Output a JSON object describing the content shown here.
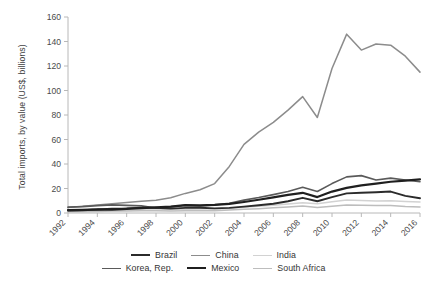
{
  "chart_data": {
    "type": "line",
    "title": "",
    "xlabel": "",
    "ylabel": "Total imports, by value (US$, billions)",
    "x": [
      1992,
      1993,
      1994,
      1995,
      1996,
      1997,
      1998,
      1999,
      2000,
      2001,
      2002,
      2003,
      2004,
      2005,
      2006,
      2007,
      2008,
      2009,
      2010,
      2011,
      2012,
      2013,
      2014,
      2015,
      2016
    ],
    "xticklabels": [
      "1992",
      "1994",
      "1996",
      "1998",
      "2000",
      "2002",
      "2004",
      "2006",
      "2008",
      "2010",
      "2012",
      "2014",
      "2016"
    ],
    "yticklabels": [
      "0",
      "20",
      "40",
      "60",
      "80",
      "100",
      "120",
      "140",
      "160"
    ],
    "ylim": [
      0,
      160
    ],
    "xlim": [
      1992,
      2016
    ],
    "grid": false,
    "legend_position": "bottom",
    "series": [
      {
        "name": "Brazil",
        "color": "#2b2b2b",
        "width": 1.9,
        "values": [
          2.0,
          2.3,
          2.8,
          3.6,
          3.8,
          4.4,
          4.3,
          3.6,
          4.2,
          4.3,
          3.8,
          4.2,
          5.2,
          6.3,
          7.6,
          9.6,
          12.4,
          9.6,
          13.0,
          16.0,
          16.5,
          17.0,
          17.5,
          14.0,
          12.0
        ]
      },
      {
        "name": "China",
        "color": "#8c8c8c",
        "width": 1.5,
        "values": [
          4.5,
          5.5,
          6.5,
          7.5,
          8.5,
          9.5,
          10.5,
          12.5,
          16.0,
          19.0,
          24.0,
          38.0,
          56.0,
          66.0,
          74.0,
          84.0,
          95.0,
          78.0,
          118.0,
          146.0,
          133.0,
          138.0,
          137.0,
          128.0,
          115.0
        ]
      },
      {
        "name": "India",
        "color": "#d2d2d2",
        "width": 1.5,
        "values": [
          1.2,
          1.4,
          1.6,
          2.0,
          2.2,
          2.4,
          2.5,
          2.8,
          3.1,
          3.2,
          3.4,
          3.9,
          4.7,
          5.5,
          6.4,
          7.4,
          8.4,
          7.6,
          9.2,
          10.6,
          10.2,
          9.8,
          10.0,
          9.4,
          9.0
        ]
      },
      {
        "name": "Korea, Rep.",
        "color": "#5a5a5a",
        "width": 1.6,
        "values": [
          4.8,
          5.2,
          6.0,
          6.6,
          6.2,
          5.8,
          4.0,
          5.0,
          6.2,
          5.8,
          6.6,
          8.0,
          10.5,
          12.6,
          15.0,
          17.5,
          21.0,
          17.5,
          24.0,
          29.5,
          30.5,
          27.0,
          28.5,
          27.0,
          25.5
        ]
      },
      {
        "name": "Mexico",
        "color": "#1f1f1f",
        "width": 2.2,
        "values": [
          2.4,
          2.6,
          3.0,
          2.8,
          3.4,
          4.0,
          4.6,
          5.2,
          6.4,
          6.2,
          6.6,
          7.4,
          9.0,
          10.8,
          12.8,
          14.8,
          16.5,
          13.0,
          17.5,
          20.5,
          22.5,
          24.0,
          25.5,
          26.5,
          27.5
        ]
      },
      {
        "name": "South Africa",
        "color": "#bdbdbd",
        "width": 1.5,
        "values": [
          1.0,
          1.1,
          1.3,
          1.6,
          1.7,
          1.8,
          1.8,
          1.7,
          1.9,
          1.8,
          1.9,
          2.4,
          3.0,
          3.5,
          4.2,
          5.0,
          5.8,
          4.4,
          5.6,
          6.6,
          6.4,
          6.2,
          6.2,
          5.4,
          5.0
        ]
      }
    ]
  },
  "legend": {
    "rows": [
      [
        {
          "label": "Brazil",
          "color": "#2b2b2b",
          "width": 2.2
        },
        {
          "label": "China",
          "color": "#8c8c8c",
          "width": 1.6
        },
        {
          "label": "India",
          "color": "#d2d2d2",
          "width": 1.6
        }
      ],
      [
        {
          "label": "Korea, Rep.",
          "color": "#5a5a5a",
          "width": 1.8
        },
        {
          "label": "Mexico",
          "color": "#1f1f1f",
          "width": 2.6
        },
        {
          "label": "South Africa",
          "color": "#bdbdbd",
          "width": 1.6
        }
      ]
    ]
  },
  "axes": {
    "axis_color": "#b8b8b8",
    "tick_color": "#b8b8b8",
    "text_color": "#4a4a4a"
  }
}
